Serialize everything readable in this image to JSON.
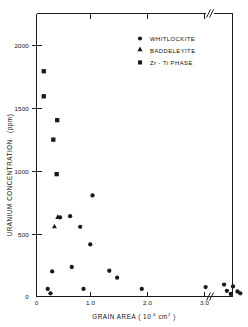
{
  "chart_data": {
    "type": "scatter",
    "title": "",
    "xlabel": "GRAIN  AREA ( 10⁻⁶ cm² )",
    "ylabel": "URANIUM  CONCENTRATION  (ppm)",
    "xlabel_parts": {
      "prefix": "GRAIN   AREA ( 10",
      "exponent": "-6",
      "middle": " cm",
      "exponent2": "2",
      "suffix": " )"
    },
    "ylabel_parts": {
      "main": "URANIUM   CONCENTRATION",
      "units": "(ppm)"
    },
    "xlim": [
      0,
      3.6
    ],
    "ylim": [
      0,
      2250
    ],
    "xticks": [
      0,
      1.0,
      2.0,
      3.0
    ],
    "xticklabels": [
      "0",
      "1.0",
      "2.0",
      "3.0"
    ],
    "yticks": [
      0,
      500,
      1000,
      1500,
      2000
    ],
    "yticklabels": [
      "0",
      "500",
      "1000",
      "1500",
      "2000"
    ],
    "grid": false,
    "axis_break": {
      "present": true,
      "axis": "x",
      "position": 3.12,
      "symbol": "//"
    },
    "legend_position": "upper-center-right",
    "series": [
      {
        "name": "WHITLOCKITE",
        "marker": "circle",
        "color": "#1a1a1a",
        "points": [
          [
            0.2,
            60
          ],
          [
            0.25,
            25
          ],
          [
            0.28,
            200
          ],
          [
            0.42,
            630
          ],
          [
            0.6,
            640
          ],
          [
            0.63,
            235
          ],
          [
            0.78,
            555
          ],
          [
            0.84,
            60
          ],
          [
            0.96,
            415
          ],
          [
            1.0,
            805
          ],
          [
            1.3,
            205
          ],
          [
            1.44,
            150
          ],
          [
            1.88,
            60
          ],
          [
            3.02,
            75
          ],
          [
            3.26,
            95
          ],
          [
            3.31,
            45
          ],
          [
            3.38,
            20
          ],
          [
            3.42,
            80
          ],
          [
            3.5,
            40
          ],
          [
            3.55,
            25
          ]
        ]
      },
      {
        "name": "BADDELEYITE",
        "marker": "triangle",
        "color": "#1a1a1a",
        "points": [
          [
            0.32,
            560
          ],
          [
            0.38,
            635
          ]
        ]
      },
      {
        "name": "Zr - Ti  PHASE",
        "marker": "square",
        "color": "#1a1a1a",
        "points": [
          [
            0.13,
            1795
          ],
          [
            0.13,
            1595
          ],
          [
            0.3,
            1250
          ],
          [
            0.37,
            1405
          ],
          [
            0.36,
            975
          ]
        ]
      }
    ]
  },
  "legend": {
    "items": [
      {
        "label": "WHITLOCKITE",
        "marker": "circle"
      },
      {
        "label": "BADDELEYITE",
        "marker": "triangle"
      },
      {
        "label": "Zr - Ti  PHASE",
        "marker": "square"
      }
    ]
  },
  "colors": {
    "axis": "#1a1a1a",
    "marker": "#1a1a1a",
    "background": "#ffffff"
  }
}
